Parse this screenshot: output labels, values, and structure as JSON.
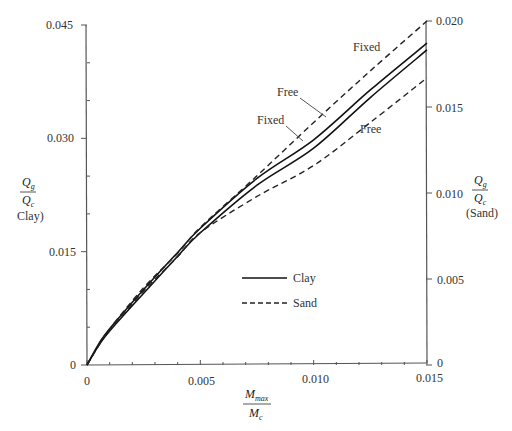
{
  "chart_data": {
    "type": "line",
    "title": "",
    "xlabel": "M_max / M_c",
    "ylabel_left": "Q_g / Q_c (Clay)",
    "ylabel_right": "Q_g / Q_c (Sand)",
    "xlim": [
      0,
      0.015
    ],
    "ylim_left": [
      0,
      0.045
    ],
    "ylim_right": [
      0,
      0.02
    ],
    "x_ticks": [
      "0",
      "0.005",
      "0.010",
      "0.015"
    ],
    "y_ticks_left": [
      "0",
      "0.015",
      "0.030",
      "0.045"
    ],
    "y_ticks_right": [
      "0",
      "0.005",
      "0.010",
      "0.015",
      "0.020"
    ],
    "grid": false,
    "legend_position": "inside-center",
    "legend": [
      {
        "label": "Clay",
        "style": "solid"
      },
      {
        "label": "Sand",
        "style": "dashed"
      }
    ],
    "x": [
      0,
      0.0005,
      0.001,
      0.0025,
      0.004,
      0.005,
      0.0075,
      0.01,
      0.0125,
      0.015
    ],
    "series": [
      {
        "name": "Clay – Free",
        "axis": "left",
        "style": "solid",
        "values": [
          0,
          0.0027,
          0.0048,
          0.01,
          0.0149,
          0.0181,
          0.0247,
          0.0298,
          0.0364,
          0.0426
        ]
      },
      {
        "name": "Clay – Fixed",
        "axis": "left",
        "style": "solid",
        "values": [
          0,
          0.0025,
          0.0045,
          0.0095,
          0.0144,
          0.0175,
          0.0238,
          0.0287,
          0.0354,
          0.0417
        ]
      },
      {
        "name": "Sand – Fixed",
        "axis": "right",
        "style": "dashed",
        "values": [
          0,
          0.0011,
          0.0021,
          0.0045,
          0.0065,
          0.008,
          0.011,
          0.0141,
          0.0171,
          0.02
        ]
      },
      {
        "name": "Sand – Free",
        "axis": "right",
        "style": "dashed",
        "values": [
          0,
          0.0011,
          0.002,
          0.0043,
          0.0063,
          0.0077,
          0.0098,
          0.0116,
          0.0141,
          0.0167
        ]
      }
    ],
    "annotations": [
      {
        "text": "Fixed",
        "target": "Sand – Fixed"
      },
      {
        "text": "Free",
        "target": "Clay – Free"
      },
      {
        "text": "Fixed",
        "target": "Clay – Fixed"
      },
      {
        "text": "Free",
        "target": "Sand – Free"
      }
    ]
  },
  "labels": {
    "y_left_num": "Q",
    "y_left_num_sub": "g",
    "y_left_den": "Q",
    "y_left_den_sub": "c",
    "y_left_note": "Clay)",
    "y_right_num": "Q",
    "y_right_num_sub": "g",
    "y_right_den": "Q",
    "y_right_den_sub": "c",
    "y_right_note": "(Sand)",
    "x_num": "M",
    "x_num_sub": "max",
    "x_den": "M",
    "x_den_sub": "c",
    "ann_sand_fixed": "Fixed",
    "ann_clay_free": "Free",
    "ann_clay_fixed": "Fixed",
    "ann_sand_free": "Free",
    "legend_clay": "Clay",
    "legend_sand": "Sand"
  }
}
